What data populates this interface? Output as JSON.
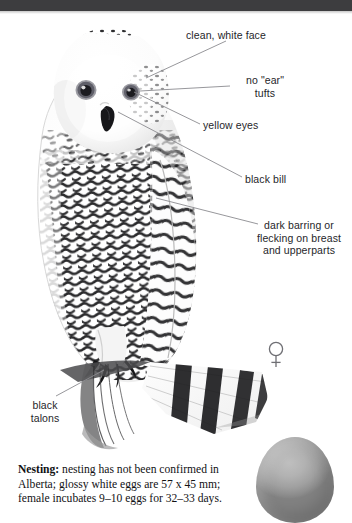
{
  "page": {
    "background_color": "#ffffff",
    "top_band_color": "#3d3d3f",
    "width": 352,
    "height": 523
  },
  "species": {
    "common_name": "Snowy Owl",
    "sex_symbol": "female-symbol"
  },
  "annotations": [
    {
      "id": "clean-white-face",
      "text": "clean, white face",
      "x": 186,
      "y": 29,
      "align": "left"
    },
    {
      "id": "no-ear-tufts",
      "text": "no \"ear\"\ntufts",
      "x": 224,
      "y": 74,
      "align": "center"
    },
    {
      "id": "yellow-eyes",
      "text": "yellow eyes",
      "x": 203,
      "y": 119,
      "align": "left"
    },
    {
      "id": "black-bill",
      "text": "black bill",
      "x": 245,
      "y": 173,
      "align": "left"
    },
    {
      "id": "dark-barring",
      "text": "dark barring or\nflecking on breast\nand upperparts",
      "x": 250,
      "y": 219,
      "align": "center"
    },
    {
      "id": "black-talons",
      "text": "black\ntalons",
      "x": 20,
      "y": 399,
      "align": "center"
    }
  ],
  "nesting": {
    "lead_label": "Nesting:",
    "body": " nesting has not been confirmed in Alberta; glossy white eggs are 57 x 45 mm; female incubates 9–10 eggs for 32–33 days.",
    "egg_dimensions": "57 x 45 mm",
    "clutch_size": "9–10 eggs",
    "incubation": "32–33 days",
    "region": "Alberta"
  },
  "egg": {
    "color": "#a8a8a8",
    "label": "egg-illustration"
  },
  "colors": {
    "text": "#26262a",
    "caption_text": "#111114",
    "leader_line": "#8b8b90",
    "plumage_dark": "#1e1e20",
    "plumage_light": "#ffffff"
  }
}
